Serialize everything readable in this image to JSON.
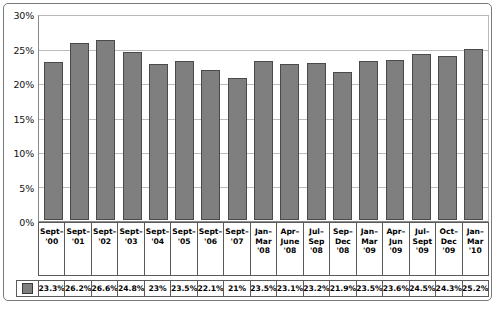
{
  "chart_data": {
    "type": "bar",
    "title": "",
    "xlabel": "",
    "ylabel": "",
    "ylim": [
      0,
      30
    ],
    "ytick_labels": [
      "30%",
      "25%",
      "20%",
      "15%",
      "10%",
      "5%",
      "0%"
    ],
    "ytick_values": [
      30,
      25,
      20,
      15,
      10,
      5,
      0
    ],
    "grid": true,
    "legend_position": "bottom-left",
    "categories": [
      "Sept–\n'00",
      "Sept–\n'01",
      "Sept–\n'02",
      "Sept–\n'03",
      "Sept–\n'04",
      "Sept–\n'05",
      "Sept–\n'06",
      "Sept–\n'07",
      "Jan–\nMar\n'08",
      "Apr–\nJune\n'08",
      "Jul–\nSep\n'08",
      "Sep–\nDec\n'08",
      "Jan–\nMar\n'09",
      "Apr–\nJun\n'09",
      "Jul–\nSept\n'09",
      "Oct–\nDec\n'09",
      "Jan–\nMar\n'10"
    ],
    "values": [
      23.3,
      26.2,
      26.6,
      24.8,
      23,
      23.5,
      22.1,
      21,
      23.5,
      23.1,
      23.2,
      21.9,
      23.5,
      23.6,
      24.5,
      24.3,
      25.2
    ],
    "value_labels": [
      "23.3%",
      "26.2%",
      "26.6%",
      "24.8%",
      "23%",
      "23.5%",
      "22.1%",
      "21%",
      "23.5%",
      "23.1%",
      "23.2%",
      "21.9%",
      "23.5%",
      "23.6%",
      "24.5%",
      "24.3%",
      "25.2%"
    ],
    "bar_color": "#7f7f7f",
    "bar_border_color": "#4a4a4a",
    "grid_color": "#bdbdbd",
    "axis_color": "#8a8a8a"
  }
}
